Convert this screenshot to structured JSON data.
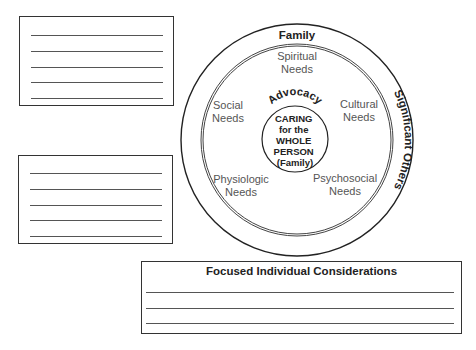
{
  "diagram": {
    "outer_ring": {
      "top_label": "Family",
      "right_label": "Significant Others"
    },
    "needs": [
      {
        "line1": "Spiritual",
        "line2": "Needs"
      },
      {
        "line1": "Social",
        "line2": "Needs"
      },
      {
        "line1": "Cultural",
        "line2": "Needs"
      },
      {
        "line1": "Physiologic",
        "line2": "Needs"
      },
      {
        "line1": "Psychosocial",
        "line2": "Needs"
      }
    ],
    "arc_label": "Advocacy",
    "center": [
      "CARING",
      "for the",
      "WHOLE",
      "PERSON",
      "(Family)"
    ]
  },
  "boxes": {
    "top_left": {
      "lines": 5
    },
    "mid_left": {
      "lines": 5
    },
    "bottom": {
      "title": "Focused Individual Considerations",
      "lines": 3
    }
  }
}
